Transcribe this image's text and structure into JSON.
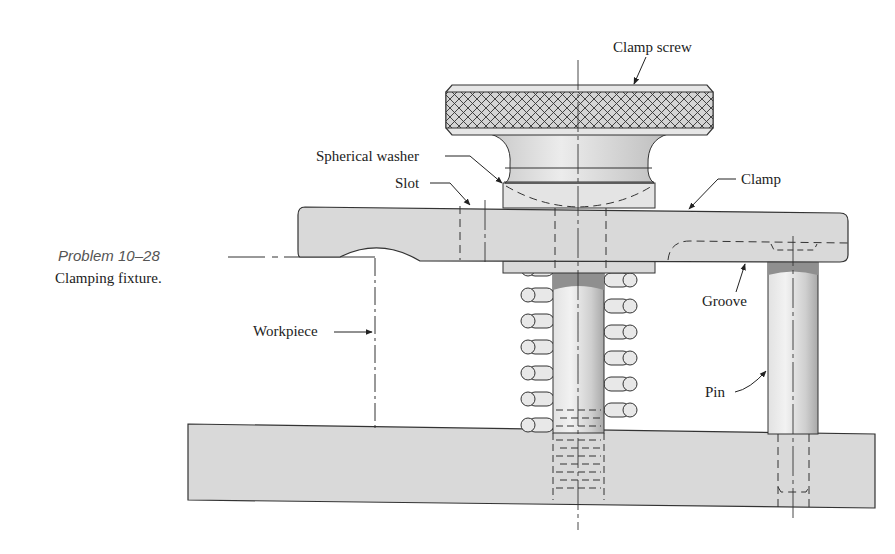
{
  "caption": {
    "problem": "Problem 10–28",
    "title": "Clamping fixture."
  },
  "labels": {
    "clamp_screw": "Clamp screw",
    "spherical_washer": "Spherical washer",
    "slot": "Slot",
    "clamp": "Clamp",
    "groove": "Groove",
    "workpiece": "Workpiece",
    "pin": "Pin"
  },
  "colors": {
    "part_fill": "#d9d9d9",
    "line": "#333333",
    "knurl_fill": "#cfcfcf",
    "pin_dark": "#9a9a9a"
  }
}
